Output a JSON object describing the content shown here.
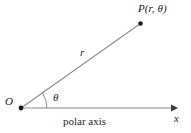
{
  "figure": {
    "background_color": "#ffffff",
    "line_color": "#8c8c8c",
    "dark_line_color": "#555555",
    "text_color": "#1a1a1a",
    "labels": {
      "point_p": "P(r, θ)",
      "radius": "r",
      "theta": "θ",
      "origin": "O",
      "x_axis": "x",
      "polar_axis": "polar axis"
    },
    "geometry": {
      "origin": {
        "x": 21,
        "y": 108
      },
      "point_p": {
        "x": 141,
        "y": 23
      },
      "x_axis_start": {
        "x": 21,
        "y": 108
      },
      "x_axis_end": {
        "x": 177,
        "y": 108
      },
      "angle_arc_radius": 26,
      "angle_degrees": 35
    }
  }
}
